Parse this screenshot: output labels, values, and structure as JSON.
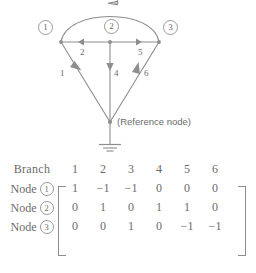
{
  "diagram": {
    "nodes": [
      {
        "id": "1",
        "label": "1"
      },
      {
        "id": "2",
        "label": "2"
      },
      {
        "id": "3",
        "label": "3"
      }
    ],
    "reference_node_label": "(Reference node)",
    "branch_labels": {
      "b1": "1",
      "b2": "2",
      "b3": "3",
      "b4": "4",
      "b5": "5",
      "b6": "6"
    },
    "branches": [
      {
        "id": "1",
        "from": "node-1",
        "to": "reference-node",
        "direction": "down-right"
      },
      {
        "id": "2",
        "from": "node-2",
        "to": "node-1",
        "direction": "left"
      },
      {
        "id": "3",
        "from": "node-3",
        "to": "node-1",
        "direction": "arc-left"
      },
      {
        "id": "4",
        "from": "node-2",
        "to": "reference-node",
        "direction": "down"
      },
      {
        "id": "5",
        "from": "node-2",
        "to": "node-3",
        "direction": "right"
      },
      {
        "id": "6",
        "from": "reference-node",
        "to": "node-3",
        "direction": "up-right"
      }
    ],
    "ground_symbol": "ground-icon"
  },
  "matrix": {
    "corner_header": "Branch",
    "column_headers": [
      "1",
      "2",
      "3",
      "4",
      "5",
      "6"
    ],
    "row_word": "Node",
    "rows": [
      {
        "node": "1",
        "values": [
          "1",
          "−1",
          "−1",
          "0",
          "0",
          "0"
        ]
      },
      {
        "node": "2",
        "values": [
          "0",
          "1",
          "0",
          "1",
          "1",
          "0"
        ]
      },
      {
        "node": "3",
        "values": [
          "0",
          "0",
          "1",
          "0",
          "−1",
          "−1"
        ]
      }
    ]
  },
  "colors": {
    "ink": "#6b6b6b",
    "line": "#8d8d8d",
    "background": "#ffffff"
  }
}
